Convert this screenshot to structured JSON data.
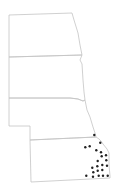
{
  "map": {
    "type": "distribution-map",
    "region_count": 4,
    "colors": {
      "border": "#c4c4c4",
      "point": "#222222",
      "background": "#ffffff"
    },
    "regions": [
      {
        "id": "north-dakota",
        "path": "M9,15 L72,13 L74,20 L78,33 L80,45 L82,55 L9,57 Z"
      },
      {
        "id": "south-dakota",
        "path": "M9,57 L82,55 L80,60 L82,64 L83,80 L84,92 L85,100 L83,101 L78,99 L70,98 L66,98 L9,98 Z"
      },
      {
        "id": "nebraska",
        "path": "M9,98 L66,98 L70,98 L78,99 L83,101 L85,100 L87,110 L90,117 L93,127 L95,133 L96,137 L30,140 L30,126 L9,126 Z"
      },
      {
        "id": "kansas",
        "path": "M30,140 L96,137 L99,139 L101,141 L103,144 L107,149 L109,153 L109,165 L110,176 L110,178 L31,182 Z"
      }
    ],
    "points": [
      [
        94.3,
        135.0
      ],
      [
        100.3,
        142.7
      ],
      [
        85.3,
        147.3
      ],
      [
        89.7,
        146.3
      ],
      [
        96.3,
        150.3
      ],
      [
        101.0,
        152.3
      ],
      [
        106.0,
        155.3
      ],
      [
        101.7,
        156.3
      ],
      [
        97.7,
        161.0
      ],
      [
        106.3,
        160.3
      ],
      [
        102.3,
        165.0
      ],
      [
        107.0,
        165.7
      ],
      [
        92.3,
        167.7
      ],
      [
        97.3,
        166.3
      ],
      [
        97.7,
        170.7
      ],
      [
        102.3,
        170.0
      ],
      [
        93.3,
        172.3
      ],
      [
        86.3,
        175.7
      ],
      [
        93.0,
        176.7
      ],
      [
        98.7,
        175.7
      ],
      [
        103.0,
        175.7
      ],
      [
        107.7,
        175.7
      ]
    ],
    "point_radius": 1.2
  }
}
